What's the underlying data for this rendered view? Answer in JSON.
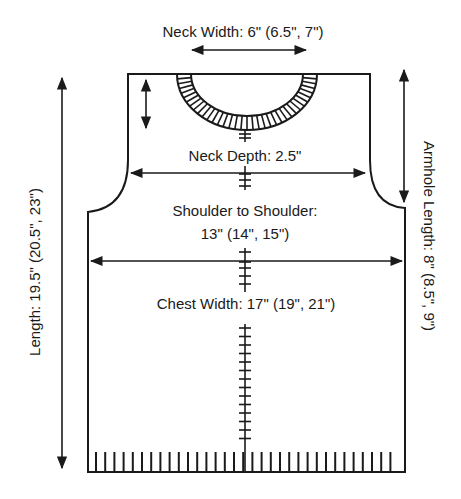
{
  "diagram": {
    "colors": {
      "ink": "#1a1a1a",
      "background": "#ffffff"
    },
    "labels": {
      "neck_width": "Neck Width: 6\" (6.5\", 7\")",
      "neck_depth": "Neck Depth: 2.5\"",
      "shoulder_line1": "Shoulder to Shoulder:",
      "shoulder_line2": "13\" (14\", 15\")",
      "chest_width": "Chest Width: 17\" (19\", 21\")",
      "length": "Length: 19.5\" (20.5\", 23\")",
      "armhole_length": "Armhole Length: 8\" (8.5\", 9\")"
    },
    "measurements": [
      {
        "name": "Neck Width",
        "sizes": [
          "6\"",
          "6.5\"",
          "7\""
        ]
      },
      {
        "name": "Neck Depth",
        "sizes": [
          "2.5\""
        ]
      },
      {
        "name": "Shoulder to Shoulder",
        "sizes": [
          "13\"",
          "14\"",
          "15\""
        ]
      },
      {
        "name": "Chest Width",
        "sizes": [
          "17\"",
          "19\"",
          "21\""
        ]
      },
      {
        "name": "Length",
        "sizes": [
          "19.5\"",
          "20.5\"",
          "23\""
        ]
      },
      {
        "name": "Armhole Length",
        "sizes": [
          "8\"",
          "8.5\"",
          "9\""
        ]
      }
    ]
  }
}
